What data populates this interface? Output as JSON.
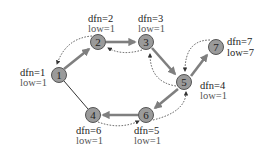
{
  "diagram": {
    "type": "tarjan-dfs-graph",
    "nodes": [
      {
        "id": "1",
        "label": "1",
        "x": 59,
        "y": 75,
        "dfn": "dfn=1",
        "low": "low=1"
      },
      {
        "id": "2",
        "label": "2",
        "x": 98,
        "y": 42,
        "dfn": "dfn=2",
        "low": "low=1"
      },
      {
        "id": "3",
        "label": "3",
        "x": 146,
        "y": 42,
        "dfn": "dfn=3",
        "low": "low=1"
      },
      {
        "id": "5",
        "label": "5",
        "x": 184,
        "y": 82,
        "dfn": "dfn=4",
        "low": "low=1"
      },
      {
        "id": "7",
        "label": "7",
        "x": 216,
        "y": 47,
        "dfn": "dfn=7",
        "low": "low=7"
      },
      {
        "id": "6",
        "label": "6",
        "x": 146,
        "y": 115,
        "dfn": "dfn=5",
        "low": "low=1"
      },
      {
        "id": "4",
        "label": "4",
        "x": 93,
        "y": 115,
        "dfn": "dfn=6",
        "low": "low=1"
      }
    ],
    "tree_edges": [
      {
        "from": "1",
        "to": "2"
      },
      {
        "from": "2",
        "to": "3"
      },
      {
        "from": "3",
        "to": "5"
      },
      {
        "from": "5",
        "to": "7"
      },
      {
        "from": "5",
        "to": "6"
      },
      {
        "from": "6",
        "to": "4"
      }
    ],
    "plain_edges": [
      {
        "from": "1",
        "to": "4"
      }
    ],
    "backtrack_edges": [
      {
        "from": "2",
        "to": "1"
      },
      {
        "from": "3",
        "to": "2"
      },
      {
        "from": "5",
        "to": "3"
      },
      {
        "from": "7",
        "to": "5"
      },
      {
        "from": "6",
        "to": "5"
      },
      {
        "from": "4",
        "to": "6"
      }
    ],
    "colors": {
      "node_fill": "#9a9a9a",
      "node_stroke": "#555555",
      "tree_edge": "#7f7f7f",
      "text": "#222222"
    }
  }
}
